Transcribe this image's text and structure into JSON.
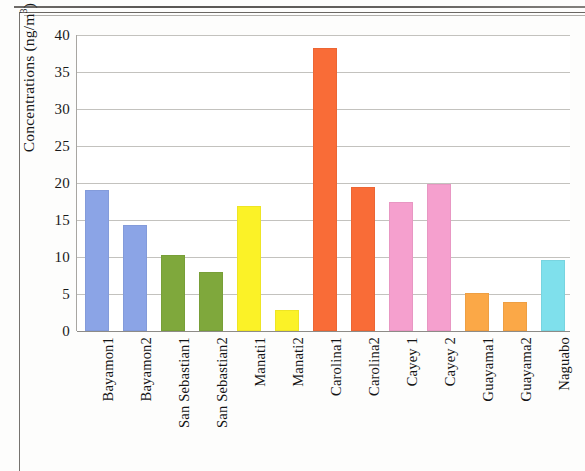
{
  "chart_data": {
    "type": "bar",
    "title": "",
    "xlabel": "",
    "ylabel": "Concentrations (ng/m³)",
    "ylabel_main": "Concentrations (ng/m",
    "ylabel_sup": "3",
    "ylabel_close": ")",
    "ylim": [
      0,
      40
    ],
    "ytick_step": 5,
    "yticks": [
      "0",
      "5",
      "10",
      "15",
      "20",
      "25",
      "30",
      "35",
      "40"
    ],
    "grid": "horizontal",
    "legend": "none",
    "categories": [
      "Bayamon1",
      "Bayamon2",
      "San Sebastian1",
      "San Sebastian2",
      "Manati1",
      "Manati2",
      "Carolina1",
      "Carolina2",
      "Cayey 1",
      "Cayey 2",
      "Guayama1",
      "Guayama2",
      "Naguabo"
    ],
    "values": [
      19.0,
      14.3,
      10.3,
      8.0,
      16.9,
      2.9,
      38.2,
      19.5,
      17.4,
      19.8,
      5.1,
      3.9,
      9.6
    ],
    "colors": [
      "#8BA4E6",
      "#8BA4E6",
      "#7FA83C",
      "#7FA83C",
      "#FBF227",
      "#FBF227",
      "#F96C37",
      "#F96C37",
      "#F5A0CE",
      "#F5A0CE",
      "#FBA847",
      "#FBA847",
      "#7FE0EC"
    ],
    "bars": [
      {
        "label": "Bayamon1",
        "value": 19.0,
        "color": "#8BA4E6"
      },
      {
        "label": "Bayamon2",
        "value": 14.3,
        "color": "#8BA4E6"
      },
      {
        "label": "San Sebastian1",
        "value": 10.3,
        "color": "#7FA83C"
      },
      {
        "label": "San Sebastian2",
        "value": 8.0,
        "color": "#7FA83C"
      },
      {
        "label": "Manati1",
        "value": 16.9,
        "color": "#FBF227"
      },
      {
        "label": "Manati2",
        "value": 2.9,
        "color": "#FBF227"
      },
      {
        "label": "Carolina1",
        "value": 38.2,
        "color": "#F96C37"
      },
      {
        "label": "Carolina2",
        "value": 19.5,
        "color": "#F96C37"
      },
      {
        "label": "Cayey 1",
        "value": 17.4,
        "color": "#F5A0CE"
      },
      {
        "label": "Cayey 2",
        "value": 19.8,
        "color": "#F5A0CE"
      },
      {
        "label": "Guayama1",
        "value": 5.1,
        "color": "#FBA847"
      },
      {
        "label": "Guayama2",
        "value": 3.9,
        "color": "#FBA847"
      },
      {
        "label": "Naguabo",
        "value": 9.6,
        "color": "#7FE0EC"
      }
    ]
  }
}
